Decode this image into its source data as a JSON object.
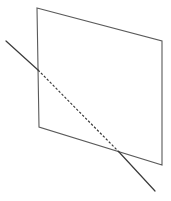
{
  "figure": {
    "background_color": "#ffffff",
    "canvas": {
      "width": 171,
      "height": 201
    },
    "plane": {
      "name": "plane-parallelogram",
      "stroke_color": "#5a5a5a",
      "stroke_width": 1.1,
      "fill": "none",
      "vertices": [
        {
          "label": "top-left",
          "x": 37,
          "y": 8
        },
        {
          "label": "top-right",
          "x": 162,
          "y": 41
        },
        {
          "label": "bottom-right",
          "x": 162,
          "y": 165
        },
        {
          "label": "bottom-left",
          "x": 39,
          "y": 127
        }
      ],
      "points_attr": "37,8 162,41 162,165 39,127"
    },
    "line": {
      "name": "intersecting-line",
      "stroke_color": "#3a3a3a",
      "stroke_width": 1.2,
      "dash_pattern": "2.4 1.8",
      "start": {
        "x": 6,
        "y": 41
      },
      "end": {
        "x": 155,
        "y": 191
      },
      "entry_point": {
        "label": "enters-plane-left-edge",
        "x": 38,
        "y": 70
      },
      "exit_point": {
        "label": "exits-plane-bottom-edge",
        "x": 119,
        "y": 152
      },
      "segments": [
        {
          "style": "solid",
          "x1": 6,
          "y1": 41,
          "x2": 38,
          "y2": 70
        },
        {
          "style": "dashed",
          "x1": 38,
          "y1": 70,
          "x2": 119,
          "y2": 152
        },
        {
          "style": "solid",
          "x1": 119,
          "y1": 152,
          "x2": 155,
          "y2": 191
        }
      ]
    }
  }
}
